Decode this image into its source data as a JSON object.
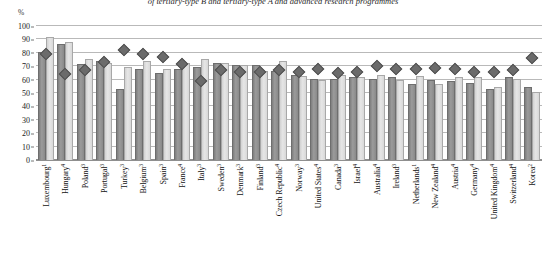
{
  "chart": {
    "title": "of tertiary-type B and tertiary-type A and advanced research programmes",
    "y_unit": "%"
  },
  "chart_data": {
    "type": "bar",
    "title": "of tertiary-type B and tertiary-type A and advanced research programmes",
    "xlabel": "",
    "ylabel": "%",
    "ylim": [
      0,
      100
    ],
    "yticks": [
      0,
      10,
      20,
      30,
      40,
      50,
      60,
      70,
      80,
      90,
      100
    ],
    "grid": true,
    "legend": "none",
    "categories": [
      "Luxembourg",
      "Hungary",
      "Poland",
      "Portugal",
      "Turkey",
      "Belgium",
      "Spain",
      "France",
      "Italy",
      "Sweden",
      "Denmark",
      "Finland",
      "Czech Republic",
      "Norway",
      "United States",
      "Canada",
      "Israel",
      "Australia",
      "Ireland",
      "Netherlands",
      "New Zealand",
      "Austria",
      "Germany",
      "United Kingdom",
      "Switzerland",
      "Korea"
    ],
    "category_notes": [
      "1",
      "4",
      "3",
      "3",
      "3",
      "3",
      "3",
      "4",
      "3",
      "3",
      "3",
      "3",
      "4",
      "3",
      "4",
      "3",
      "4",
      "4",
      "3",
      "1",
      "4",
      "4",
      "4",
      "4",
      "4",
      "2"
    ],
    "series": [
      {
        "name": "dark-bar",
        "values": [
          80,
          86,
          71,
          73,
          52,
          67,
          64,
          67,
          69,
          72,
          70,
          70,
          66,
          63,
          60,
          60,
          61,
          60,
          61,
          56,
          59,
          58,
          57,
          52,
          61,
          54
        ]
      },
      {
        "name": "light-bar",
        "values": [
          91,
          87,
          75,
          72,
          69,
          73,
          67,
          72,
          75,
          72,
          70,
          66,
          73,
          62,
          59,
          63,
          61,
          63,
          59,
          62,
          56,
          61,
          61,
          54,
          60,
          50
        ]
      },
      {
        "name": "diamond-marker",
        "values": [
          79,
          64,
          67,
          73,
          82,
          79,
          77,
          72,
          59,
          67,
          66,
          66,
          67,
          66,
          68,
          65,
          66,
          70,
          68,
          68,
          69,
          68,
          66,
          66,
          67,
          76
        ]
      }
    ]
  }
}
